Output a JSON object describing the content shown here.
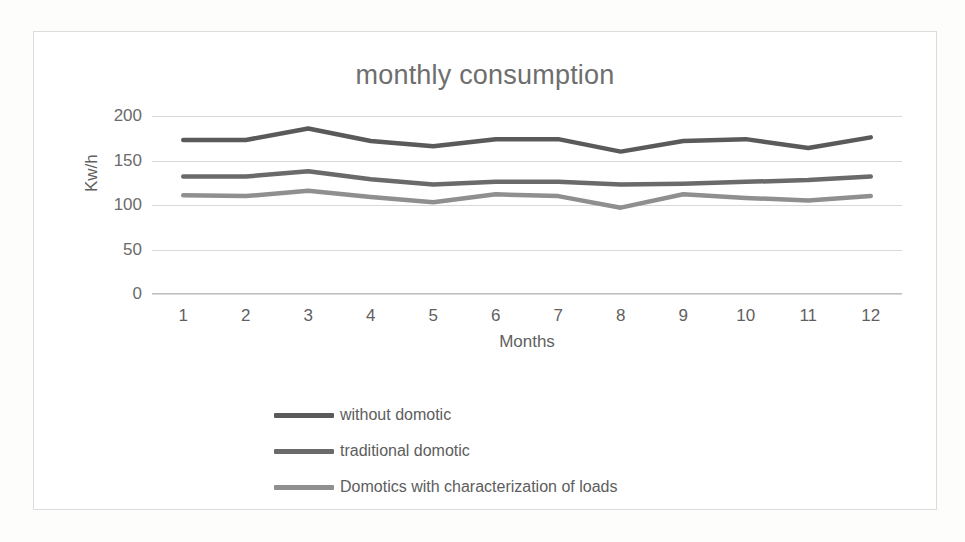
{
  "chart_data": {
    "type": "line",
    "title": "monthly consumption",
    "xlabel": "Months",
    "ylabel": "Kw/h",
    "categories": [
      "1",
      "2",
      "3",
      "4",
      "5",
      "6",
      "7",
      "8",
      "9",
      "10",
      "11",
      "12"
    ],
    "x": [
      1,
      2,
      3,
      4,
      5,
      6,
      7,
      8,
      9,
      10,
      11,
      12
    ],
    "ylim": [
      0,
      200
    ],
    "yticks": [
      0,
      50,
      100,
      150,
      200
    ],
    "grid": true,
    "legend_position": "bottom-left",
    "series": [
      {
        "name": "without domotic",
        "color": "#5a5a5a",
        "values": [
          173,
          173,
          186,
          172,
          166,
          174,
          174,
          160,
          172,
          174,
          164,
          176
        ]
      },
      {
        "name": "traditional domotic",
        "color": "#6a6a6a",
        "values": [
          132,
          132,
          138,
          129,
          123,
          126,
          126,
          123,
          124,
          126,
          128,
          132
        ]
      },
      {
        "name": "Domotics with characterization of loads",
        "color": "#8f8f8f",
        "values": [
          111,
          110,
          116,
          109,
          103,
          112,
          110,
          97,
          112,
          108,
          105,
          110
        ]
      }
    ]
  },
  "colors": {
    "frame": "#dcdcdc",
    "gridline": "#d9d9d9",
    "text": "#5f5f5f",
    "title": "#6e6e6e",
    "background": "#ffffff"
  }
}
